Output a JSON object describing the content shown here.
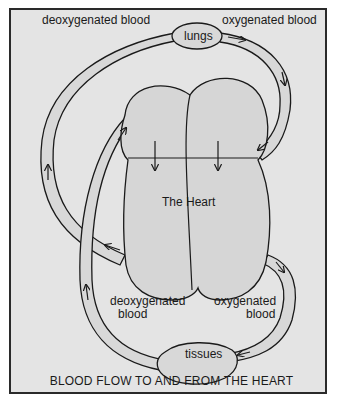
{
  "diagram": {
    "title": "BLOOD FLOW TO AND FROM THE HEART",
    "heart_label": "The Heart",
    "organs": {
      "lungs": "lungs",
      "tissues": "tissues"
    },
    "labels": {
      "top_left": "deoxygenated blood",
      "top_right": "oxygenated blood",
      "bottom_left_line1": "deoxygenated",
      "bottom_left_line2": "blood",
      "bottom_right_line1": "oxygenated",
      "bottom_right_line2": "blood"
    },
    "colors": {
      "background": "#e4e4e4",
      "heart_fill": "#d6d6d6",
      "vessel_fill": "#d8d8d8",
      "stroke": "#1a1a1a"
    }
  }
}
